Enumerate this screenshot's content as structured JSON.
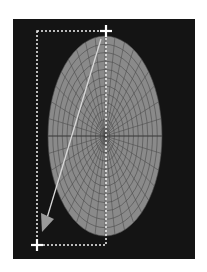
{
  "scene": {
    "description": "Ellipse mesh with selection rectangle and drag arrow",
    "colors": {
      "page_background": "#ffffff",
      "viewport_background": "#141414",
      "ellipse_fill": "#8a8a8a",
      "mesh_lines": "#4a4a4a",
      "selection_dash": "#f2f2f2",
      "arrow": "#d8d8d8",
      "arrow_head": "#9a9a9a",
      "handle": "#ffffff"
    },
    "mesh": {
      "radial_lines": 36,
      "concentric_rings": 12
    },
    "icons": {
      "start_handle": "crosshair-plus-icon",
      "end_handle": "crosshair-plus-icon",
      "drag_arrow": "arrow-down-left-icon"
    }
  }
}
